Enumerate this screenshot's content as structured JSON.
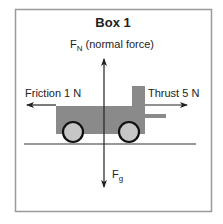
{
  "diagram": {
    "title": "Box 1",
    "labels": {
      "normal_force_symbol": "F",
      "normal_force_subscript": "N",
      "normal_force_text": " (normal force)",
      "friction": "Friction 1 N",
      "thrust": "Thrust 5 N",
      "gravity_symbol": "F",
      "gravity_subscript": "g"
    },
    "forces": [
      {
        "name": "normal force",
        "direction": "up"
      },
      {
        "name": "friction",
        "magnitude": "1 N",
        "direction": "left"
      },
      {
        "name": "thrust",
        "magnitude": "5 N",
        "direction": "right"
      },
      {
        "name": "gravity",
        "direction": "down"
      }
    ],
    "colors": {
      "cart_body": "#8a8a8a",
      "wheel_fill": "#c6c6c6",
      "wheel_stroke": "#111111",
      "arrow": "#222222",
      "border": "#999999",
      "ground": "#333333"
    }
  }
}
